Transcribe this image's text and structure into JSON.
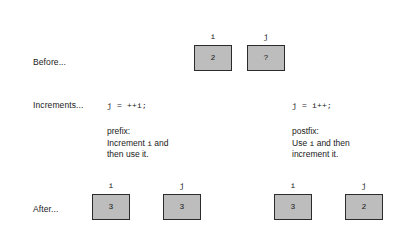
{
  "diagram": {
    "colors": {
      "box_fill": "#bdbdbd",
      "box_border": "#2b2b2b",
      "text": "#1a1a1a",
      "background": "#ffffff"
    },
    "rows": {
      "before": {
        "label": "Before...",
        "boxes": [
          {
            "name": "i",
            "value": "2"
          },
          {
            "name": "j",
            "value": "?"
          }
        ]
      },
      "increments": {
        "label": "Increments...",
        "left": {
          "code": "j = ++i;",
          "note_title": "prefix:",
          "note_line1_pre": "Increment ",
          "note_line1_var": "i",
          "note_line1_post": " and",
          "note_line2": "then use it."
        },
        "right": {
          "code": "j = i++;",
          "note_title": "postfix:",
          "note_line1_pre": "Use ",
          "note_line1_var": "i",
          "note_line1_post": " and then",
          "note_line2": "increment it."
        }
      },
      "after": {
        "label": "After...",
        "left_boxes": [
          {
            "name": "i",
            "value": "3"
          },
          {
            "name": "j",
            "value": "3"
          }
        ],
        "right_boxes": [
          {
            "name": "i",
            "value": "3"
          },
          {
            "name": "j",
            "value": "2"
          }
        ]
      }
    }
  }
}
